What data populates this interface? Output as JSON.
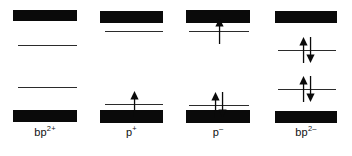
{
  "figure": {
    "background_color": "#ffffff",
    "band_color": "#0a0a0a",
    "level_color": "#2b2b2b",
    "electron_color": "#0a0a0a",
    "width": 352,
    "height": 156
  },
  "columns": [
    {
      "id": "col-bp2plus",
      "label_base": "bp",
      "label_charge": "2+",
      "label_full": "bp2+",
      "x": 13,
      "width": 64,
      "label_x": 13,
      "label_width": 64,
      "label_y": 126,
      "bands": [
        {
          "name": "upper-band",
          "y": 10,
          "height": 11
        },
        {
          "name": "lower-band",
          "y": 110,
          "height": 12
        }
      ],
      "levels": [
        {
          "name": "level-upper",
          "y": 45,
          "x": 5,
          "width": 59,
          "electrons": []
        },
        {
          "name": "level-lower",
          "y": 87,
          "x": 5,
          "width": 59,
          "electrons": []
        }
      ]
    },
    {
      "id": "col-pplus",
      "label_base": "p",
      "label_charge": "+",
      "label_full": "p+",
      "x": 100,
      "width": 63,
      "label_x": 100,
      "label_width": 63,
      "label_y": 126,
      "bands": [
        {
          "name": "upper-band",
          "y": 11,
          "height": 12
        },
        {
          "name": "lower-band",
          "y": 110,
          "height": 13
        }
      ],
      "levels": [
        {
          "name": "level-upper",
          "y": 31,
          "x": 5,
          "width": 58,
          "electrons": []
        },
        {
          "name": "level-lower",
          "y": 104,
          "x": 5,
          "width": 58,
          "electrons": [
            "up"
          ]
        }
      ]
    },
    {
      "id": "col-pminus",
      "label_base": "p",
      "label_charge": "–",
      "label_full": "p-",
      "x": 186,
      "width": 64,
      "label_x": 186,
      "label_width": 64,
      "label_y": 126,
      "bands": [
        {
          "name": "upper-band",
          "y": 10,
          "height": 13
        },
        {
          "name": "lower-band",
          "y": 110,
          "height": 13
        }
      ],
      "levels": [
        {
          "name": "level-upper",
          "y": 31,
          "x": 3,
          "width": 60,
          "electrons": [
            "up"
          ]
        },
        {
          "name": "level-lower",
          "y": 105,
          "x": 3,
          "width": 60,
          "electrons": [
            "up",
            "down"
          ]
        }
      ]
    },
    {
      "id": "col-bp2minus",
      "label_base": "bp",
      "label_charge": "2–",
      "label_full": "bp2-",
      "x": 275,
      "width": 62,
      "label_x": 275,
      "label_width": 62,
      "label_y": 126,
      "bands": [
        {
          "name": "upper-band",
          "y": 11,
          "height": 12
        },
        {
          "name": "lower-band",
          "y": 111,
          "height": 12
        }
      ],
      "levels": [
        {
          "name": "level-upper",
          "y": 50,
          "x": 3,
          "width": 58,
          "electrons": [
            "up",
            "down"
          ]
        },
        {
          "name": "level-lower",
          "y": 89,
          "x": 3,
          "width": 58,
          "electrons": [
            "up",
            "down"
          ]
        }
      ]
    }
  ]
}
